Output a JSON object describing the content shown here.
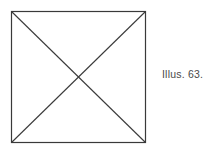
{
  "page": {
    "background_color": "#ffffff",
    "width": 224,
    "height": 150
  },
  "figure": {
    "name": "square-with-diagonals",
    "stroke_color": "#3a3a3a",
    "stroke_width": 1,
    "fill": "none",
    "bounds": {
      "left": 11,
      "top": 11,
      "width": 135,
      "height": 132
    },
    "vertices": {
      "top_left": [
        0,
        0
      ],
      "top_right": [
        135,
        0
      ],
      "bottom_right": [
        135,
        132
      ],
      "bottom_left": [
        0,
        132
      ]
    },
    "diagonals": [
      {
        "name": "diagonal-tl-br",
        "from": [
          0,
          0
        ],
        "to": [
          135,
          132
        ]
      },
      {
        "name": "diagonal-tr-bl",
        "from": [
          135,
          0
        ],
        "to": [
          0,
          132
        ]
      }
    ],
    "intersection": [
      67.5,
      66
    ]
  },
  "caption": {
    "text": "Illus. 63.",
    "color": "#4a4a4a"
  }
}
